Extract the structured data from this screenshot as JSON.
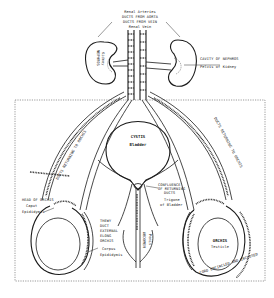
{
  "diagram": {
    "colors": {
      "ink": "#1a1a1a",
      "background": "#ffffff"
    },
    "labels": {
      "renal_arteries": "Renal Arteries",
      "ducts_from_aorta": "DUCTS FROM AORTA",
      "ducts_from_vein": "DUCTS FROM VEIN",
      "renal_vein": "Renal Vein",
      "nephros": "NEPHROS",
      "kidney": "Kidney",
      "cavity_of_nephros": "CAVITY OF NEPHROS",
      "pelvis_of_kidney": "Pelvis of Kidney",
      "cystis": "CYSTIS",
      "bladder": "Bladder",
      "head_of_orchis": "HEAD OF ORCHIS",
      "caput": "Caput",
      "epididymis": "Epididymis",
      "confluence_1": "CONFLUENCE",
      "confluence_2": "OF RETURNING",
      "confluence_3": "DUCTS",
      "trigone": "Trigone",
      "of_bladder": "of Bladder",
      "duct_1": "THEWY",
      "duct_2": "DUCT",
      "duct_3": "EXTERNAL",
      "duct_4": "ELONG",
      "duct_5": "ORCHIS",
      "corpus": "Corpus",
      "corpus_epididymis": "Epididymis",
      "abdomen": "ABDOMEN",
      "penis": "Penis",
      "orchis": "ORCHIS",
      "testicle": "Testicle",
      "left_duct_label": "DUCTS RETURNING TO ORCHIS",
      "right_duct_label": "DUCTS RETURNING TO ORCHIS",
      "scrotum_label": "CORD ENCIRCLED AND INCLOSED"
    }
  }
}
